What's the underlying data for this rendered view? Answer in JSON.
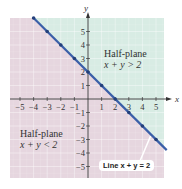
{
  "chart_data": {
    "type": "line",
    "title": "",
    "xlabel": "x",
    "ylabel": "y",
    "xlim": [
      -5.7,
      5.7
    ],
    "ylim": [
      -5.8,
      6
    ],
    "xticks": [
      -5,
      -4,
      -3,
      -2,
      -1,
      1,
      2,
      3,
      4,
      5
    ],
    "yticks": [
      -5,
      -4,
      -3,
      -2,
      -1,
      1,
      2,
      3,
      4,
      5
    ],
    "grid": true,
    "series": [
      {
        "name": "Line x + y = 2",
        "x": [
          -4,
          -3,
          -2,
          -1,
          0,
          1,
          2,
          3,
          4,
          5
        ],
        "values": [
          6,
          5,
          4,
          3,
          2,
          1,
          0,
          -1,
          -2,
          -3
        ],
        "color": "#3a5fa8"
      }
    ],
    "regions": [
      {
        "name": "Half-plane x + y > 2",
        "color": "#d8ece4"
      },
      {
        "name": "Half-plane x + y < 2",
        "color": "#e6d6df"
      }
    ],
    "annotations": [
      {
        "text": "Half-plane",
        "subtext": "x + y > 2"
      },
      {
        "text": "Half-plane",
        "subtext": "x + y < 2"
      },
      {
        "text": "Line x + y = 2"
      }
    ]
  },
  "labels": {
    "x_axis": "x",
    "y_axis": "y",
    "upper_title": "Half-plane",
    "upper_ineq": "x + y > 2",
    "lower_title": "Half-plane",
    "lower_ineq": "x + y < 2",
    "line_label": "Line x + y = 2"
  }
}
